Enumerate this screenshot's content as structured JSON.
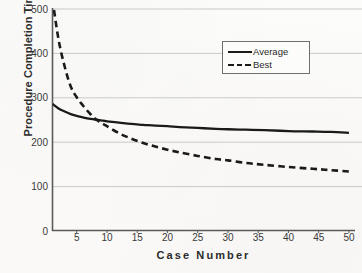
{
  "chart_data": {
    "type": "line",
    "title": "",
    "xlabel": "Case Number",
    "ylabel": "Procedure Completion Time",
    "xlim": [
      1,
      51
    ],
    "ylim": [
      0,
      500
    ],
    "grid": true,
    "grid_axis": "y",
    "legend_position": "top-right",
    "x_ticks": [
      5,
      10,
      15,
      20,
      25,
      30,
      35,
      40,
      45,
      50
    ],
    "y_ticks": [
      0,
      100,
      200,
      300,
      400,
      500
    ],
    "x": [
      1,
      2,
      3,
      4,
      5,
      6,
      7,
      8,
      9,
      10,
      12,
      14,
      16,
      18,
      20,
      22,
      25,
      28,
      30,
      33,
      36,
      40,
      44,
      47,
      50
    ],
    "series": [
      {
        "name": "Average",
        "style": "solid",
        "color": "#1a1a1a",
        "values": [
          285,
          275,
          268,
          262,
          258,
          255,
          252,
          250,
          248,
          246,
          243,
          240,
          238,
          236,
          235,
          233,
          231,
          229,
          228,
          227,
          226,
          224,
          223,
          222,
          220
        ]
      },
      {
        "name": "Best",
        "style": "dashed",
        "color": "#1a1a1a",
        "values": [
          520,
          430,
          370,
          325,
          300,
          282,
          266,
          252,
          243,
          235,
          219,
          207,
          197,
          189,
          182,
          176,
          168,
          161,
          158,
          152,
          148,
          143,
          139,
          136,
          133
        ]
      }
    ],
    "colors": {
      "background": "#fbfbf9",
      "axis": "#5a5a5a",
      "gridline": "#c9c9c9",
      "text": "#2b2b2b",
      "tick_text": "#3a3a3a",
      "legend_border": "#6f6f6f",
      "series_line": "#1a1a1a"
    },
    "legend": [
      {
        "label": "Average",
        "style": "solid"
      },
      {
        "label": "Best",
        "style": "dashed"
      }
    ]
  }
}
